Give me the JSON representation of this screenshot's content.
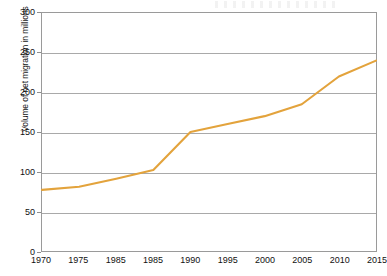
{
  "chart_data": {
    "type": "line",
    "title": "",
    "subtitle": "",
    "xlabel": "",
    "ylabel": "Volume of net migration in millions",
    "x": [
      1970,
      1975,
      1980,
      1985,
      1990,
      1995,
      2000,
      2005,
      2010,
      2015
    ],
    "x_tick_labels": [
      "1970",
      "1975",
      "1985",
      "1985",
      "1990",
      "1995",
      "2000",
      "2005",
      "2010",
      "2015"
    ],
    "values": [
      77,
      81,
      91,
      102,
      150,
      160,
      170,
      185,
      220,
      240
    ],
    "series": [
      {
        "name": "Volume of net migration in millions",
        "color": "#e3a33c",
        "values": [
          77,
          81,
          91,
          102,
          150,
          160,
          170,
          185,
          220,
          240
        ]
      }
    ],
    "ylim": [
      0,
      300
    ],
    "y_ticks": [
      0,
      50,
      100,
      150,
      200,
      250,
      300
    ],
    "y_tick_labels": [
      "0",
      "50",
      "100",
      "150",
      "200",
      "250",
      "300"
    ],
    "xlim": [
      1970,
      2015
    ],
    "grid": "horizontal",
    "legend": "none",
    "annotations": []
  },
  "colors": {
    "line": "#e3a33c",
    "grid": "#a9a9a9",
    "frame": "#9a9a9a",
    "text": "#111111",
    "background": "#ffffff"
  }
}
